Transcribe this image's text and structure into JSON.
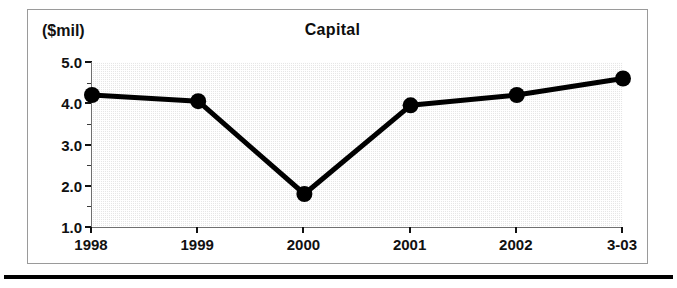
{
  "chart_data": {
    "type": "line",
    "title": "Capital",
    "xlabel": "",
    "ylabel": "($mil)",
    "unit_caption": "($mil)",
    "categories": [
      "1998",
      "1999",
      "2000",
      "2001",
      "2002",
      "3-03"
    ],
    "values": [
      4.2,
      4.05,
      1.8,
      3.95,
      4.2,
      4.6
    ],
    "series": [
      {
        "name": "Capital",
        "values": [
          4.2,
          4.05,
          1.8,
          3.95,
          4.2,
          4.6
        ]
      }
    ],
    "ylim": [
      1.0,
      5.0
    ],
    "ytick_labels": [
      "5.0",
      "4.0",
      "3.0",
      "2.0",
      "1.0"
    ],
    "ytick_values": [
      5.0,
      4.0,
      3.0,
      2.0,
      1.0
    ],
    "yminor_values": [
      4.5,
      3.5,
      2.5,
      1.5
    ],
    "grid": false,
    "legend": "none",
    "colors": {
      "line": "#000000",
      "marker": "#000000",
      "plot_background": "#e6e6e6",
      "axis": "#111111",
      "frame": "#9a9a9a",
      "text": "#111111"
    }
  }
}
